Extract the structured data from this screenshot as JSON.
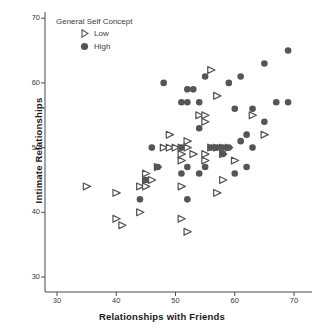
{
  "chart_data": {
    "type": "scatter",
    "title": "",
    "xlabel": "Relationships with Friends",
    "ylabel": "Intimate Relationships",
    "xlim": [
      26,
      73
    ],
    "ylim": [
      27,
      72
    ],
    "xticks": [
      30,
      40,
      50,
      60,
      70
    ],
    "yticks": [
      30,
      40,
      50,
      60,
      70
    ],
    "grid": false,
    "legend": {
      "title": "General Self Concept",
      "position": "top-left-inside",
      "entries": [
        {
          "label": "Low",
          "marker": "triangle-right-outline",
          "color": "#555555"
        },
        {
          "label": "High",
          "marker": "circle-filled",
          "color": "#555555"
        }
      ]
    },
    "series": [
      {
        "name": "Low",
        "marker": "triangle-right-outline",
        "color": "#555555",
        "points": [
          [
            35,
            44
          ],
          [
            40,
            43
          ],
          [
            40,
            39
          ],
          [
            41,
            38
          ],
          [
            44,
            44
          ],
          [
            45,
            46
          ],
          [
            45,
            44
          ],
          [
            45,
            45
          ],
          [
            46,
            45
          ],
          [
            44,
            40
          ],
          [
            47,
            47
          ],
          [
            48,
            50
          ],
          [
            49,
            50
          ],
          [
            49,
            52
          ],
          [
            50,
            50
          ],
          [
            51,
            50
          ],
          [
            51,
            49
          ],
          [
            51,
            48
          ],
          [
            51,
            44
          ],
          [
            51,
            39
          ],
          [
            52,
            51
          ],
          [
            52,
            50
          ],
          [
            52,
            37
          ],
          [
            53,
            49
          ],
          [
            54,
            55
          ],
          [
            55,
            55
          ],
          [
            55,
            54
          ],
          [
            55,
            49
          ],
          [
            55,
            48
          ],
          [
            56,
            50
          ],
          [
            56,
            62
          ],
          [
            57,
            50
          ],
          [
            57,
            43
          ],
          [
            57,
            58
          ],
          [
            58,
            50
          ],
          [
            58,
            49
          ],
          [
            58,
            45
          ],
          [
            59,
            50
          ],
          [
            60,
            48
          ],
          [
            63,
            55
          ],
          [
            65,
            52
          ]
        ]
      },
      {
        "name": "High",
        "marker": "circle-filled",
        "color": "#555555",
        "points": [
          [
            44,
            42
          ],
          [
            45,
            45
          ],
          [
            46,
            50
          ],
          [
            47,
            47
          ],
          [
            48,
            60
          ],
          [
            51,
            46
          ],
          [
            51,
            50
          ],
          [
            51,
            57
          ],
          [
            52,
            47
          ],
          [
            52,
            57
          ],
          [
            52,
            59
          ],
          [
            52,
            42
          ],
          [
            53,
            59
          ],
          [
            54,
            53
          ],
          [
            54,
            57
          ],
          [
            54,
            46
          ],
          [
            55,
            61
          ],
          [
            55,
            47
          ],
          [
            56,
            50
          ],
          [
            57,
            50
          ],
          [
            58,
            50
          ],
          [
            58,
            49
          ],
          [
            59,
            50
          ],
          [
            59,
            60
          ],
          [
            60,
            46
          ],
          [
            60,
            56
          ],
          [
            61,
            51
          ],
          [
            61,
            61
          ],
          [
            62,
            47
          ],
          [
            62,
            52
          ],
          [
            63,
            50
          ],
          [
            63,
            56
          ],
          [
            65,
            54
          ],
          [
            65,
            63
          ],
          [
            67,
            57
          ],
          [
            69,
            57
          ],
          [
            69,
            65
          ]
        ]
      }
    ],
    "geometry": {
      "plot_left": 45,
      "plot_right": 310,
      "plot_top": 12,
      "plot_bottom": 292,
      "x_pixel_per_unit": 5.925,
      "y_pixel_per_unit": 6.47,
      "x_origin_value": 30,
      "x_origin_pixel": 57,
      "y_origin_value": 30,
      "y_origin_pixel": 277
    }
  }
}
